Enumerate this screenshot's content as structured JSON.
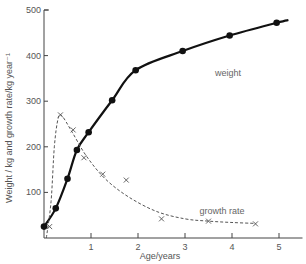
{
  "chart_data": {
    "type": "line",
    "title": "",
    "xlabel": "Age/years",
    "ylabel": "Weight / kg and growth rate/kg year⁻¹",
    "xlim": [
      0,
      5.5
    ],
    "ylim": [
      0,
      500
    ],
    "grid": false,
    "x_ticks": [
      1,
      2,
      3,
      4,
      5
    ],
    "y_ticks": [
      100,
      200,
      300,
      400,
      500
    ],
    "series": [
      {
        "name": "weight",
        "style": "solid-line-with-dots",
        "color": "#111111",
        "x": [
          0,
          0.25,
          0.5,
          0.7,
          0.95,
          1.45,
          1.95,
          2.95,
          3.95,
          4.95
        ],
        "values": [
          25,
          65,
          130,
          193,
          232,
          302,
          368,
          410,
          444,
          472
        ]
      },
      {
        "name": "growth rate",
        "style": "dashed-line-with-crosses",
        "color": "#555555",
        "x": [
          0.12,
          0.35,
          0.62,
          0.85,
          1.25,
          1.75,
          2.5,
          3.5,
          4.5
        ],
        "values": [
          25,
          270,
          237,
          176,
          140,
          127,
          42,
          37,
          31
        ]
      }
    ],
    "annotations": [
      {
        "text": "weight",
        "x": 3.8,
        "y": 400
      },
      {
        "text": "growth rate",
        "x": 3.3,
        "y": 62
      }
    ]
  }
}
